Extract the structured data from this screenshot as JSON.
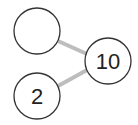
{
  "diagram": {
    "type": "number-bond",
    "whole": {
      "value": "10"
    },
    "parts": [
      {
        "value": ""
      },
      {
        "value": "2"
      }
    ],
    "colors": {
      "circle_stroke": "#333333",
      "connector": "#bdbdbd",
      "background": "#ffffff"
    }
  }
}
